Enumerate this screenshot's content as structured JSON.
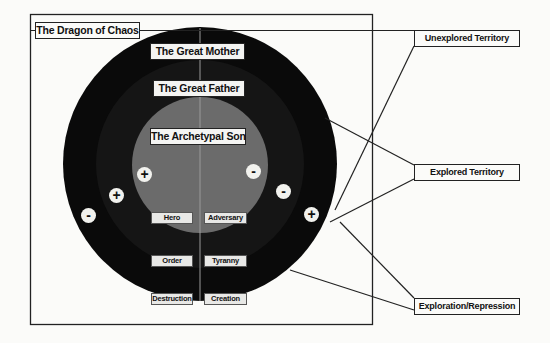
{
  "diagram": {
    "title": "The Dragon of Chaos",
    "rings": {
      "outer": "The Great Mother",
      "middle": "The Great Father",
      "inner": "The Archetypal Son"
    },
    "inner_labels": {
      "left": "Hero",
      "right": "Adversary"
    },
    "middle_labels": {
      "left": "Order",
      "right": "Tyranny"
    },
    "outer_labels": {
      "left": "Destruction",
      "right": "Creation"
    },
    "signs": {
      "inner_left": "+",
      "inner_right": "-",
      "middle_left": "+",
      "middle_right": "-",
      "outer_left": "-",
      "outer_right": "+"
    },
    "callouts": [
      {
        "label": "Unexplored Territory"
      },
      {
        "label": "Explored Territory"
      },
      {
        "label": "Exploration/Repression"
      }
    ],
    "colors": {
      "outer_ring": "#0a0a0a",
      "middle_ring": "#161616",
      "inner_circle": "#6b6b6b",
      "background": "#fbfbf9"
    }
  }
}
